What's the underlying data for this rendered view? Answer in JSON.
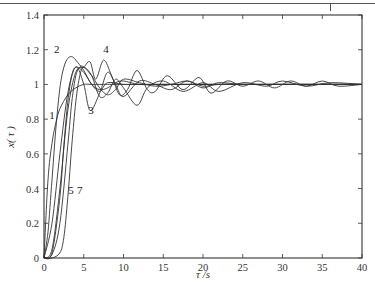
{
  "chart_data": {
    "type": "line",
    "title": "",
    "xlabel": "τ /s",
    "ylabel": "x( τ )",
    "xlim": [
      0,
      40
    ],
    "ylim": [
      0,
      1.4
    ],
    "x_ticks": [
      "0",
      "5",
      "10",
      "15",
      "20",
      "25",
      "30",
      "35",
      "40"
    ],
    "y_ticks": [
      "0",
      "0.2",
      "0.4",
      "0.6",
      "0.8",
      "1",
      "1.2",
      "1.4"
    ],
    "grid": false,
    "legend": "none (curves labeled inline: 1, 2, 3, 4, 5, 7)",
    "series": [
      {
        "name": "1",
        "x": [
          0,
          0.5,
          1,
          1.5,
          2,
          3,
          4,
          5,
          6,
          8,
          10,
          15,
          20,
          25,
          30,
          35,
          40
        ],
        "values": [
          0,
          0.45,
          0.66,
          0.78,
          0.86,
          0.94,
          0.98,
          1.0,
          1.0,
          1.0,
          1.0,
          1.0,
          1.0,
          1.0,
          1.0,
          1.0,
          1.0
        ]
      },
      {
        "name": "2",
        "x": [
          0,
          0.5,
          1,
          1.5,
          2,
          2.5,
          3,
          3.5,
          4,
          5,
          6,
          7,
          8,
          9,
          10,
          12,
          15,
          20,
          25,
          30,
          35,
          40
        ],
        "values": [
          0,
          0.15,
          0.45,
          0.75,
          0.98,
          1.1,
          1.15,
          1.16,
          1.14,
          1.08,
          1.0,
          0.97,
          0.98,
          1.01,
          1.02,
          1.0,
          1.0,
          1.0,
          1.0,
          1.0,
          1.0,
          1.0
        ]
      },
      {
        "name": "3",
        "x": [
          0,
          1,
          2,
          3,
          4,
          5,
          5.8,
          7,
          8,
          9,
          10,
          12,
          14,
          16,
          18,
          20,
          22,
          25,
          30,
          35,
          40
        ],
        "values": [
          0,
          0.2,
          0.6,
          0.95,
          1.1,
          1.0,
          0.85,
          0.95,
          1.07,
          1.0,
          0.93,
          1.02,
          1.0,
          0.97,
          1.02,
          0.98,
          1.01,
          1.0,
          1.0,
          1.0,
          1.0
        ]
      },
      {
        "name": "4",
        "x": [
          0,
          1,
          2,
          3,
          4,
          5,
          5.8,
          6.5,
          7.5,
          8.5,
          9.5,
          10.5,
          11.7,
          13,
          14,
          15.5,
          17.5,
          19.5,
          21,
          23,
          25,
          27,
          29,
          31,
          33,
          35,
          37,
          40
        ],
        "values": [
          0,
          0.05,
          0.4,
          0.85,
          1.07,
          1.1,
          1.13,
          1.03,
          1.14,
          1.05,
          0.94,
          0.97,
          1.08,
          0.97,
          0.96,
          1.05,
          0.97,
          1.04,
          0.95,
          1.02,
          0.99,
          1.02,
          0.98,
          1.02,
          0.99,
          1.02,
          0.99,
          1.0
        ]
      },
      {
        "name": "5",
        "x": [
          0,
          1,
          2,
          2.5,
          3,
          3.5,
          4,
          5,
          6,
          7,
          8,
          10,
          12,
          15,
          20,
          25,
          30,
          35,
          40
        ],
        "values": [
          0,
          0.03,
          0.35,
          0.65,
          0.9,
          1.05,
          1.1,
          1.07,
          1.0,
          0.96,
          1.01,
          1.0,
          1.0,
          1.0,
          1.0,
          1.0,
          1.0,
          1.0,
          1.0
        ]
      },
      {
        "name": "7",
        "x": [
          0,
          1,
          2,
          2.5,
          3,
          3.5,
          4,
          4.5,
          5,
          6,
          7,
          8,
          9,
          10,
          11.7,
          13,
          15,
          17.5,
          20,
          22,
          25,
          28,
          30,
          33,
          36,
          40
        ],
        "values": [
          0,
          0.0,
          0.03,
          0.12,
          0.35,
          0.65,
          0.9,
          1.05,
          1.1,
          1.05,
          0.93,
          0.95,
          1.03,
          0.98,
          0.88,
          0.98,
          1.02,
          0.96,
          1.01,
          0.96,
          1.01,
          0.99,
          1.02,
          0.99,
          1.01,
          1.0
        ]
      },
      {
        "name": "6",
        "x": [
          0,
          1,
          2,
          3,
          3.5,
          4,
          4.5,
          5,
          6,
          7,
          8,
          9,
          10,
          12,
          14,
          16,
          18,
          20,
          22,
          25,
          30,
          35,
          40
        ],
        "values": [
          0,
          0.02,
          0.2,
          0.65,
          0.9,
          1.05,
          1.1,
          1.1,
          1.05,
          0.98,
          0.94,
          0.97,
          1.03,
          1.01,
          0.99,
          1.0,
          1.02,
          0.99,
          1.0,
          1.0,
          1.0,
          1.0,
          1.0
        ]
      }
    ],
    "annotations": [
      {
        "text": "1",
        "x": 1.0,
        "y": 0.8
      },
      {
        "text": "2",
        "x": 1.6,
        "y": 1.18
      },
      {
        "text": "3",
        "x": 5.9,
        "y": 0.83
      },
      {
        "text": "4",
        "x": 7.8,
        "y": 1.18
      },
      {
        "text": "5",
        "x": 3.4,
        "y": 0.37
      },
      {
        "text": "7",
        "x": 4.5,
        "y": 0.37
      }
    ]
  },
  "labels": {
    "xlabel": "τ /s",
    "ylabel": "x( τ )",
    "curve_1": "1",
    "curve_2": "2",
    "curve_3": "3",
    "curve_4": "4",
    "curve_5": "5",
    "curve_7": "7"
  }
}
